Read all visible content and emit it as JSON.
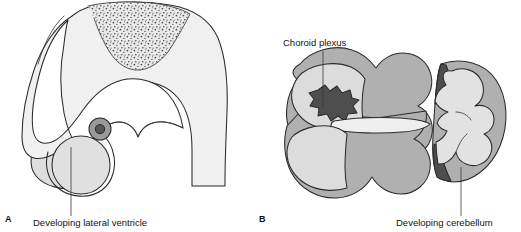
{
  "figure": {
    "type": "anatomical-illustration",
    "background_color": "#ffffff",
    "line_color": "#2b2b2b"
  },
  "palette": {
    "white": "#ffffff",
    "very_light_gray": "#f0f0f0",
    "light_gray": "#e2e2e2",
    "mid_light_gray": "#d2d2d2",
    "mid_gray": "#b0b0b0",
    "dark_gray": "#6a6a6a",
    "darker_gray": "#555555",
    "darkest_gray": "#3f3f3f",
    "stipple_dot": "#4a4a4a",
    "outline": "#2b2b2b"
  },
  "panels": [
    {
      "id": "A",
      "letter": "A",
      "letter_x": 5,
      "letter_y": 222,
      "description": "Sagittal section of developing brain showing hook-shaped hemisphere with stippled roof region, developing lateral ventricle and choroid fissure",
      "callouts": [
        {
          "id": "developing-lateral-ventricle",
          "label": "Developing lateral ventricle",
          "text_x": 33,
          "text_y": 226,
          "leader": {
            "x1": 71,
            "y1": 147,
            "x2": 71,
            "y2": 216
          }
        }
      ]
    },
    {
      "id": "B",
      "letter": "B",
      "letter_x": 259,
      "letter_y": 222,
      "description": "Dorsal view of developing hindbrain roof with choroid plexus, and transverse section of developing cerebellum",
      "callouts": [
        {
          "id": "choroid-plexus",
          "label": "Choroid plexus",
          "text_x": 283,
          "text_y": 46,
          "leader": {
            "x1": 323,
            "y1": 51,
            "x2": 323,
            "y2": 108
          }
        },
        {
          "id": "developing-cerebellum",
          "label": "Developing cerebellum",
          "text_x": 396,
          "text_y": 226,
          "leader": {
            "x1": 461,
            "y1": 167,
            "x2": 461,
            "y2": 216
          }
        }
      ]
    }
  ],
  "structures": {
    "panel_a": [
      {
        "name": "cerebral-hemisphere-outline",
        "fill": "#efefef"
      },
      {
        "name": "stippled-roof-plate",
        "fill": "#e8e8e8",
        "dots": true
      },
      {
        "name": "inner-ventricle-cavity",
        "fill": "#ffffff"
      },
      {
        "name": "developing-lateral-ventricle",
        "fill": "#e0e0e0"
      },
      {
        "name": "choroid-fissure-nodule-outer",
        "fill": "#9a9a9a"
      },
      {
        "name": "choroid-fissure-nodule-inner",
        "fill": "#555555"
      },
      {
        "name": "posterior-lobe-shade",
        "fill": "#dddddd"
      }
    ],
    "panel_b": [
      {
        "name": "hindbrain-roof-outer",
        "fill": "#b0b0b0"
      },
      {
        "name": "hindbrain-roof-inner-left",
        "fill": "#dcdcdc"
      },
      {
        "name": "choroid-plexus-blob",
        "fill": "#4e4e4e"
      },
      {
        "name": "fourth-ventricle-cleft",
        "fill": "#efefef"
      },
      {
        "name": "cerebellum-outer",
        "fill": "#b0b0b0"
      },
      {
        "name": "cerebellum-inner",
        "fill": "#e2e2e2"
      },
      {
        "name": "cerebellum-dark-wedge",
        "fill": "#4e4e4e"
      }
    ]
  }
}
